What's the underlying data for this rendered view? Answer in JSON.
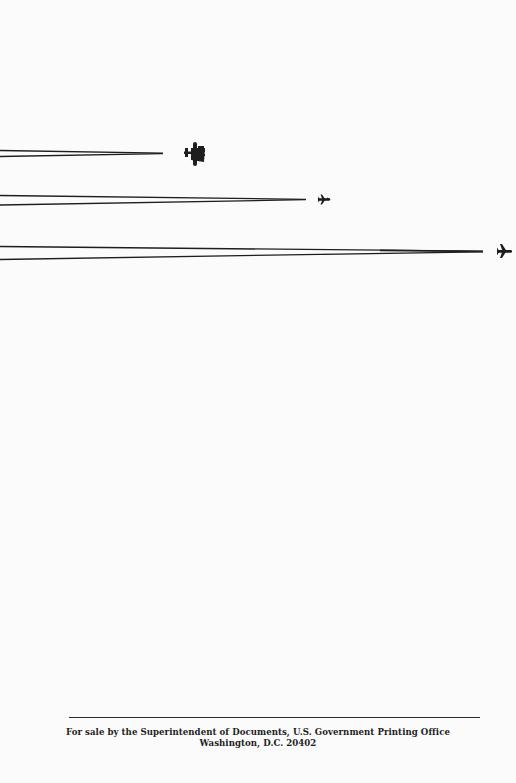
{
  "cover": {
    "illustration": {
      "description": "Three aircraft silhouettes trailing contrails",
      "aircraft": [
        {
          "name": "propeller-bomber",
          "icon": "bomber-plane-icon"
        },
        {
          "name": "small-jet",
          "icon": "jet-plane-icon"
        },
        {
          "name": "jet",
          "icon": "jet-plane-icon"
        }
      ]
    },
    "colors": {
      "ink": "#1e1e1e",
      "paper": "#fbfbfb"
    }
  },
  "footer": {
    "line1": "For sale by the Superintendent of Documents, U.S. Government Printing Office",
    "line2": "Washington, D.C. 20402"
  }
}
